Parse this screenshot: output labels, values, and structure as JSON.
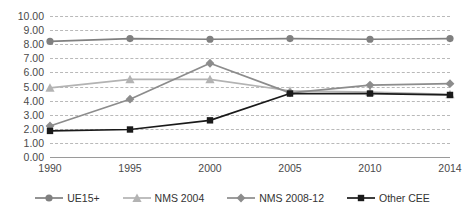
{
  "chart_data": {
    "type": "line",
    "title": "",
    "subtitle": "",
    "xlabel": "",
    "ylabel": "",
    "categories": [
      "1990",
      "1995",
      "2000",
      "2005",
      "2010",
      "2014"
    ],
    "x_tick_labels": [
      "1990",
      "1995",
      "2000",
      "2005",
      "2010",
      "2014"
    ],
    "y_tick_labels": [
      "10.00",
      "9.00",
      "8.00",
      "7.00",
      "6.00",
      "5.00",
      "4.00",
      "3.00",
      "2.00",
      "1.00",
      "0.00"
    ],
    "y_tick_values": [
      10,
      9,
      8,
      7,
      6,
      5,
      4,
      3,
      2,
      1,
      0
    ],
    "ylim": [
      0,
      10
    ],
    "grid": true,
    "grid_style": "dashed-horizontal",
    "legend_position": "bottom",
    "series": [
      {
        "name": "UE15+",
        "marker": "circle",
        "color": "#808080",
        "values": [
          8.2,
          8.4,
          8.35,
          8.4,
          8.35,
          8.4
        ]
      },
      {
        "name": "NMS 2004",
        "marker": "triangle",
        "color": "#b3b3b3",
        "values": [
          4.9,
          5.5,
          5.5,
          4.7,
          4.6,
          4.45
        ]
      },
      {
        "name": "NMS 2008-12",
        "marker": "diamond",
        "color": "#8c8c8c",
        "values": [
          2.2,
          4.1,
          6.65,
          4.55,
          5.1,
          5.2
        ]
      },
      {
        "name": "Other CEE",
        "marker": "square",
        "color": "#1a1a1a",
        "values": [
          1.85,
          1.95,
          2.6,
          4.5,
          4.5,
          4.4
        ]
      }
    ]
  },
  "legend": {
    "items": [
      {
        "label": "UE15+",
        "marker": "circle",
        "color": "#808080"
      },
      {
        "label": "NMS 2004",
        "marker": "triangle",
        "color": "#b3b3b3"
      },
      {
        "label": "NMS 2008-12",
        "marker": "diamond",
        "color": "#8c8c8c"
      },
      {
        "label": "Other CEE",
        "marker": "square",
        "color": "#1a1a1a"
      }
    ]
  },
  "colors": {
    "gridline": "#b9b9b9",
    "axis": "#9a9a9a",
    "tick_text": "#4a4a4a",
    "background": "#ffffff"
  }
}
